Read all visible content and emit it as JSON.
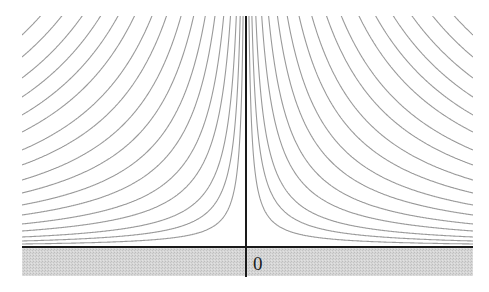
{
  "diagram": {
    "origin_label": "0",
    "colors": {
      "background": "#ffffff",
      "streamline": "#9a9a9a",
      "axis": "#1a1a1a",
      "wall_fill": "#cfcfcf"
    },
    "plot_box": {
      "left": 22,
      "right": 473,
      "top": 16,
      "axis_y": 247,
      "axis_x": 246,
      "wall_bottom": 276
    },
    "streamline_offsets_at_edge": [
      3,
      6,
      10,
      16,
      23,
      32,
      42,
      54,
      67,
      82,
      97,
      115,
      132,
      150,
      169,
      190,
      212,
      236,
      262,
      290,
      320,
      352
    ]
  }
}
